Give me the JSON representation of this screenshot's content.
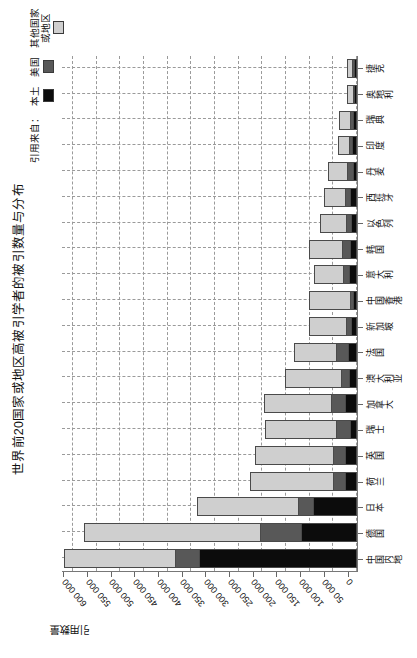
{
  "figure": {
    "title": "世界前20国家或地区高被引学者的被引数量与分布",
    "value_axis_title": "引用数量"
  },
  "legend": {
    "title": "引用来自：",
    "items": [
      {
        "label": "本土",
        "label_line2": "",
        "color": "#0c0c0c"
      },
      {
        "label": "美国",
        "label_line2": "",
        "color": "#585858"
      },
      {
        "label": "其他国家",
        "label_line2": "或地区",
        "color": "#cfcfcf"
      }
    ]
  },
  "chart_data": {
    "type": "bar",
    "subtype": "stacked-bar",
    "title": "世界前20国家或地区高被引学者的被引数量与分布",
    "xlabel": "",
    "ylabel": "引用数量",
    "ylim": [
      0,
      625000
    ],
    "ytick_values": [
      0,
      50000,
      100000,
      150000,
      200000,
      250000,
      300000,
      350000,
      400000,
      450000,
      500000,
      550000,
      600000
    ],
    "ytick_labels": [
      "0",
      "50 000",
      "100 000",
      "150 000",
      "200 000",
      "250 000",
      "300 000",
      "350 000",
      "400 000",
      "450 000",
      "500 000",
      "550 000",
      "600 000"
    ],
    "grid": true,
    "legend_position": "top-right",
    "categories": [
      "中国内地",
      "德国",
      "日本",
      "荷兰",
      "英国",
      "瑞士",
      "加拿大",
      "澳大利亚",
      "法国",
      "新加坡",
      "中国香港",
      "意大利",
      "韩国",
      "以色列",
      "西班牙",
      "丹麦",
      "印度",
      "瑞典",
      "奥地利",
      "捷克"
    ],
    "series": [
      {
        "name": "本土",
        "color": "#0c0c0c",
        "values": [
          330000,
          113000,
          88000,
          22000,
          22000,
          11000,
          22000,
          13000,
          14000,
          8000,
          5000,
          13000,
          10000,
          9000,
          10000,
          5000,
          7000,
          4000,
          1500,
          3000
        ]
      },
      {
        "name": "美国",
        "color": "#585858",
        "values": [
          48000,
          86000,
          30000,
          22000,
          22000,
          26000,
          26000,
          14000,
          24000,
          8000,
          4000,
          11000,
          16000,
          7000,
          8000,
          9000,
          3000,
          4000,
          1500,
          1500
        ]
      },
      {
        "name": "其他国家或地区",
        "color": "#cfcfcf",
        "values": [
          232000,
          368000,
          211000,
          174000,
          162000,
          149000,
          140000,
          116000,
          86000,
          78000,
          84000,
          58000,
          68000,
          53000,
          43000,
          38000,
          21000,
          22000,
          10000,
          8000
        ]
      }
    ],
    "totals": [
      610000,
      567000,
      329000,
      218000,
      206000,
      186000,
      188000,
      143000,
      124000,
      94000,
      93000,
      82000,
      94000,
      69000,
      61000,
      52000,
      31000,
      30000,
      13000,
      12500
    ]
  }
}
